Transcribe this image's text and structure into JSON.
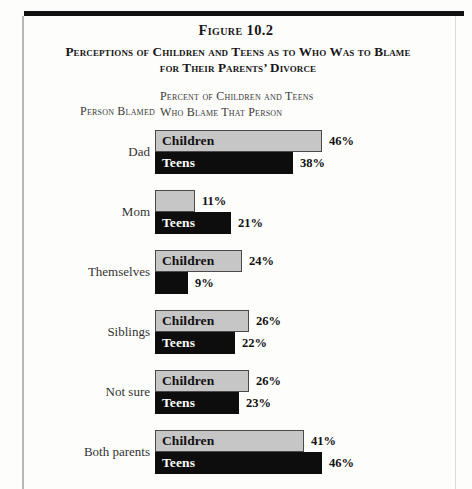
{
  "figure": {
    "number": "Figure 10.2",
    "title_line1": "Perceptions of Children and Teens as to Who Was to Blame",
    "title_line2": "for Their Parents’ Divorce",
    "left_header": "Person Blamed",
    "right_header_line1": "Percent of Children and Teens",
    "right_header_line2": "Who Blame That Person"
  },
  "chart_data": {
    "type": "bar",
    "orientation": "horizontal",
    "title": "Perceptions of Children and Teens as to Who Was to Blame for Their Parents’ Divorce",
    "subtitle": "Figure 10.2",
    "xlabel": "Percent of Children and Teens Who Blame That Person",
    "ylabel": "Person Blamed",
    "categories": [
      "Dad",
      "Mom",
      "Themselves",
      "Siblings",
      "Not sure",
      "Both parents"
    ],
    "series": [
      {
        "name": "Children",
        "color": "#c6c6c6",
        "values": [
          46,
          11,
          24,
          26,
          26,
          41
        ],
        "value_labels": [
          "46%",
          "11%",
          "24%",
          "26%",
          "26%",
          "41%"
        ],
        "inline_labels": [
          "Children",
          "",
          "Children",
          "Children",
          "Children",
          "Children"
        ]
      },
      {
        "name": "Teens",
        "color": "#0d0d0d",
        "values": [
          38,
          21,
          9,
          22,
          23,
          46
        ],
        "value_labels": [
          "38%",
          "21%",
          "9%",
          "22%",
          "23%",
          "46%"
        ],
        "inline_labels": [
          "Teens",
          "Teens",
          "",
          "Teens",
          "Teens",
          "Teens"
        ]
      }
    ],
    "xlim": [
      0,
      46
    ],
    "grid": false,
    "legend": "in-bar labels"
  }
}
